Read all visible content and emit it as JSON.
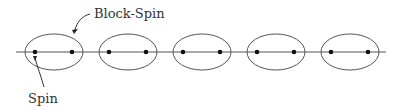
{
  "diagram": {
    "labels": {
      "block_spin": "Block-Spin",
      "spin": "Spin"
    },
    "line": {
      "x1": 16,
      "x2": 386,
      "y": 52
    },
    "blocks": [
      {
        "cx": 54,
        "spins": [
          35,
          72
        ]
      },
      {
        "cx": 128,
        "spins": [
          109,
          146
        ]
      },
      {
        "cx": 202,
        "spins": [
          183,
          220
        ]
      },
      {
        "cx": 276,
        "spins": [
          257,
          294
        ]
      },
      {
        "cx": 350,
        "spins": [
          331,
          368
        ]
      }
    ],
    "ellipse": {
      "rx": 29,
      "ry": 18
    },
    "colors": {
      "stroke": "#555555",
      "dot": "#111111"
    }
  }
}
